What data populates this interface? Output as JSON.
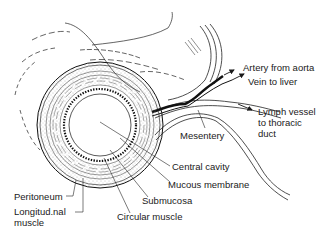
{
  "diagram": {
    "labels": {
      "artery": "Artery from aorta",
      "vein": "Vein to liver",
      "lymph_line1": "Lymph vessel",
      "lymph_line2": "to thoracic",
      "lymph_line3": "duct",
      "mesentery": "Mesentery",
      "central_cavity": "Central cavity",
      "mucous_membrane": "Mucous membrane",
      "submucosa": "Submucosa",
      "circular_muscle": "Circular muscle",
      "peritoneum": "Peritoneum",
      "longitudinal_line1": "Longitud.nal",
      "longitudinal_line2": "muscle"
    },
    "colors": {
      "ink": "#1a1a1a",
      "stipple": "#8a8a8a",
      "background": "#ffffff"
    }
  }
}
